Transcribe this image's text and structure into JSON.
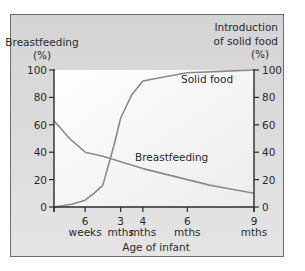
{
  "chart_data": {
    "type": "line",
    "title": "",
    "xlabel": "Age of infant",
    "ylabel_left": "Breastfeeding (%)",
    "ylabel_right": "Introduction of solid food (%)",
    "ylim": [
      0,
      100
    ],
    "xlim_months": [
      0,
      9
    ],
    "y_ticks": [
      0,
      20,
      40,
      60,
      80,
      100
    ],
    "x_ticks": [
      {
        "value_months": 1.4,
        "label_top": "6",
        "label_bottom": "weeks"
      },
      {
        "value_months": 3,
        "label_top": "3",
        "label_bottom": "mths"
      },
      {
        "value_months": 4,
        "label_top": "4",
        "label_bottom": "mths"
      },
      {
        "value_months": 6,
        "label_top": "6",
        "label_bottom": "mths"
      },
      {
        "value_months": 9,
        "label_top": "9",
        "label_bottom": "mths"
      }
    ],
    "grid": false,
    "series": [
      {
        "name": "Breastfeeding",
        "axis": "left",
        "x": [
          0,
          0.7,
          1.4,
          2.2,
          3,
          4,
          5,
          6,
          7,
          8,
          9
        ],
        "values": [
          63,
          50,
          40,
          37,
          33,
          28,
          24,
          20,
          16,
          13,
          10
        ]
      },
      {
        "name": "Solid food",
        "axis": "right",
        "x": [
          0,
          0.8,
          1.4,
          1.8,
          2.2,
          2.7,
          3,
          3.5,
          4,
          5,
          6,
          7.5,
          9
        ],
        "values": [
          0,
          2,
          5,
          10,
          16,
          45,
          65,
          82,
          92,
          95,
          98,
          99,
          100
        ]
      }
    ],
    "annotations": [
      {
        "text": "Solid food",
        "near_series": "Solid food"
      },
      {
        "text": "Breastfeeding",
        "near_series": "Breastfeeding"
      }
    ]
  },
  "labels": {
    "left_axis_title_1": "Breastfeeding",
    "left_axis_title_2": "(%)",
    "right_axis_title_1": "Introduction",
    "right_axis_title_2": "of solid food",
    "right_axis_title_3": "(%)",
    "x_axis_title": "Age of infant",
    "solid_food": "Solid food",
    "breastfeeding": "Breastfeeding"
  },
  "colors": {
    "line": "#8a8a8a",
    "axis": "#2a2a2a",
    "plot_bg": "#f6f6f6",
    "frame_bg": "#d8d8d8"
  }
}
